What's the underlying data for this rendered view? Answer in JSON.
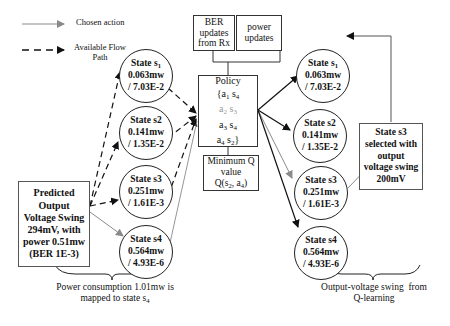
{
  "legend": {
    "chosen_action": "Chosen action",
    "available_flow_line1": "Available Flow",
    "available_flow_line2": "Path"
  },
  "predicted_box": {
    "line1": "Predicted",
    "line2": "Output",
    "line3": "Voltage Swing",
    "line4": "294mV, with",
    "line5": "power 0.51mw",
    "line6": "(BER 1E-3)"
  },
  "left_states": [
    {
      "title": "State s",
      "sub": "1",
      "power": "0.063mw",
      "ber": "/ 7.03E-2"
    },
    {
      "title": "State s2",
      "sub": "",
      "power": "0.141mw",
      "ber": "/ 1.35E-2"
    },
    {
      "title": "State s3",
      "sub": "",
      "power": "0.251mw",
      "ber": "/ 1.61E-3"
    },
    {
      "title": "State s4",
      "sub": "",
      "power": "0.564mw",
      "ber": "/ 4.93E-6"
    }
  ],
  "right_states": [
    {
      "title": "State s",
      "sub": "1",
      "power": "0.063mw",
      "ber": "/ 7.03E-2"
    },
    {
      "title": "State s2",
      "sub": "",
      "power": "0.141mw",
      "ber": "/ 1.35E-2"
    },
    {
      "title": "State s3",
      "sub": "",
      "power": "0.251mw",
      "ber": "/ 1.61E-3"
    },
    {
      "title": "State s4",
      "sub": "",
      "power": "0.564mw",
      "ber": "/ 4.93E-6"
    }
  ],
  "ber_box": {
    "line1": "BER",
    "line2": "updates",
    "line3": "from Rx"
  },
  "power_box": {
    "line1": "power",
    "line2": "updates"
  },
  "policy_box": {
    "title": "Policy",
    "rows": [
      {
        "a": "{a",
        "a_sub": "1",
        "s": " s",
        "s_sub": "4",
        "end": ""
      },
      {
        "a": "a",
        "a_sub": "2",
        "s": " s",
        "s_sub": "3",
        "end": ""
      },
      {
        "a": "a",
        "a_sub": "3",
        "s": " s",
        "s_sub": "4",
        "end": ""
      },
      {
        "a": "a",
        "a_sub": "4",
        "s": " s",
        "s_sub": "2",
        "end": "}"
      }
    ]
  },
  "minq_box": {
    "line1": "Minimum Q",
    "line2": "value",
    "line3_prefix": "Q(s",
    "line3_sub1": "2",
    "line3_mid": ", a",
    "line3_sub2": "4",
    "line3_suffix": ")"
  },
  "selected_box": {
    "line1": "State s3",
    "line2": "selected with",
    "line3": "output",
    "line4": "voltage swing",
    "line5": "200mV"
  },
  "left_caption": {
    "line1": "Power consumption 1.01mw is",
    "line2_prefix": "mapped to state s",
    "line2_sub": "4"
  },
  "right_caption": {
    "line1": "Output-voltage swing  from",
    "line2": "Q-learning"
  },
  "colors": {
    "chosen_arrow": "#8a8a8a",
    "dashed_arrow": "#111111",
    "solid_arrow": "#111111",
    "border": "#333333"
  }
}
